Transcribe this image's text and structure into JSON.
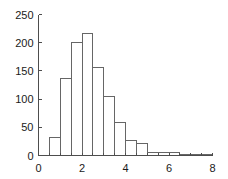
{
  "chart_data": {
    "type": "bar",
    "title": "",
    "subtitle": "",
    "xlabel": "",
    "ylabel": "",
    "xlim": [
      0,
      8
    ],
    "ylim": [
      0,
      250
    ],
    "grid": false,
    "legend": null,
    "bin_width": 0.5,
    "x_ticks": [
      0,
      2,
      4,
      6,
      8
    ],
    "x_tick_labels": [
      "0",
      "2",
      "4",
      "6",
      "8"
    ],
    "y_ticks": [
      0,
      50,
      100,
      150,
      200,
      250
    ],
    "y_tick_labels": [
      "0",
      "50",
      "100",
      "150",
      "200",
      "250"
    ],
    "bin_edges": [
      0.5,
      1.0,
      1.5,
      2.0,
      2.5,
      3.0,
      3.5,
      4.0,
      4.5,
      5.0,
      5.5,
      6.0,
      6.5,
      7.0,
      7.5,
      8.0
    ],
    "categories": [
      "0.5-1.0",
      "1.0-1.5",
      "1.5-2.0",
      "2.0-2.5",
      "2.5-3.0",
      "3.0-3.5",
      "3.5-4.0",
      "4.0-4.5",
      "4.5-5.0",
      "5.0-5.5",
      "5.5-6.0",
      "6.0-6.5",
      "6.5-7.0",
      "7.0-7.5",
      "7.5-8.0"
    ],
    "values": [
      32,
      136,
      200,
      217,
      156,
      105,
      59,
      26,
      22,
      5,
      6,
      6,
      1,
      1,
      1
    ]
  }
}
